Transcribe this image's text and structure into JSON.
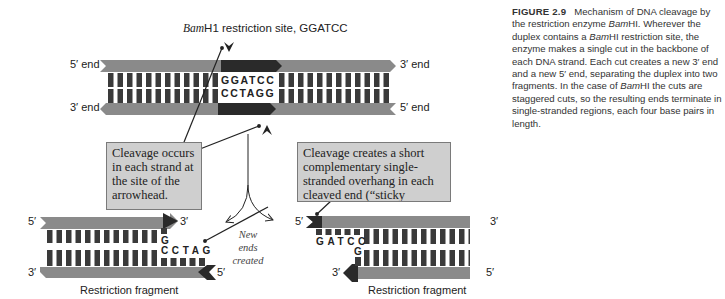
{
  "figure": {
    "number_label": "FIGURE 2.9",
    "caption_parts": {
      "p1": "Mechanism of DNA cleavage by the restriction enzyme ",
      "enzyme1": "Bam",
      "p2": "HI. Wherever the duplex contains a ",
      "enzyme2": "Bam",
      "p3": "HI restriction site, the enzyme makes a single cut in the backbone of each DNA strand. Each cut creates a new 3′ end and a new 5′ end, separating the duplex into two fragments. In the case of ",
      "enzyme3": "Bam",
      "p4": "HI the cuts are staggered cuts, so the resulting ends terminate in single-stranded regions, each four base pairs in length."
    }
  },
  "top_duplex": {
    "site_label_italic": "Bam",
    "site_label_rest": "H1 restriction site, GGATCC",
    "left_top_end": "5′ end",
    "left_bottom_end": "3′ end",
    "right_top_end": "3′ end",
    "right_bottom_end": "5′ end",
    "top_sequence": [
      "G",
      "G",
      "A",
      "T",
      "C",
      "C"
    ],
    "bottom_sequence": [
      "C",
      "C",
      "T",
      "A",
      "G",
      "G"
    ]
  },
  "callouts": {
    "cleavage_site": "Cleavage occurs in each strand at the site of the arrowhead.",
    "sticky_ends": "Cleavage creates a short complementary single-stranded overhang in each cleaved end (“sticky"
  },
  "new_ends_label": "New ends created",
  "left_fragment": {
    "top_left": "5′",
    "top_right": "3′",
    "bottom_left": "3′",
    "bottom_right": "5′",
    "top_base": "G",
    "bottom_overhang": [
      "C",
      "C",
      "T",
      "A",
      "G"
    ],
    "label": "Restriction fragment"
  },
  "right_fragment": {
    "top_left": "5′",
    "top_right": "3′",
    "bottom_left": "3′",
    "bottom_right": "5′",
    "top_overhang": [
      "G",
      "A",
      "T",
      "C",
      "C"
    ],
    "bottom_base": "G",
    "label": "Restriction fragment"
  },
  "colors": {
    "backbone": "#8a8a8a",
    "site_backbone": "#2a2a2a",
    "base_bar": "#3a3a3a",
    "callout_bg": "#cfcfcf"
  }
}
